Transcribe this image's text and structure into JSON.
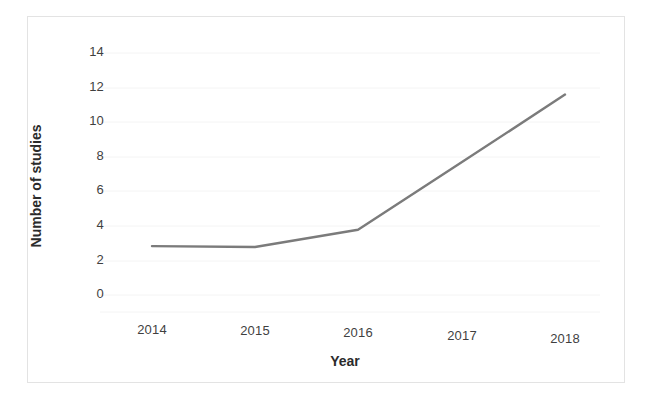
{
  "chart_data": {
    "type": "line",
    "title": "",
    "subtitle": "",
    "xlabel": "Year",
    "ylabel": "Number of studies",
    "categories": [
      "2014",
      "2015",
      "2016",
      "2017",
      "2018"
    ],
    "x": [
      2014,
      2015,
      2016,
      2017,
      2018
    ],
    "values": [
      2.85,
      2.8,
      3.8,
      7.7,
      11.6
    ],
    "series": [
      {
        "name": "Number of studies",
        "values": [
          2.85,
          2.8,
          3.8,
          7.7,
          11.6
        ]
      }
    ],
    "ylim": [
      0,
      15
    ],
    "xlim": [
      2014,
      2018
    ],
    "yticks": [
      0,
      2,
      4,
      6,
      8,
      10,
      12,
      14
    ],
    "ytick_labels": [
      "0",
      "2",
      "4",
      "6",
      "8",
      "10",
      "12",
      "14"
    ],
    "xtick_labels": [
      "2014",
      "2015",
      "2016",
      "2017",
      "2018"
    ],
    "grid": "horizontal-faint",
    "legend": "none",
    "line_color": "#7b7b7b",
    "text_color": "#3f3f3f",
    "axis_label_color": "#2b2b2b",
    "background_color": "#ffffff",
    "border_color": "#e3e3e3",
    "gridline_color": "#f4f4f4",
    "annotations": []
  }
}
